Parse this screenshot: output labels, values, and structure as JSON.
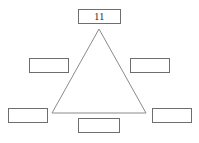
{
  "page": {
    "background_color": "#ffffff",
    "width": 199,
    "height": 143
  },
  "diagram": {
    "name": "triangle-diagram",
    "shape": "triangle",
    "stroke_color": "#8a8a8a",
    "fill": "none",
    "vertices": {
      "apex": {
        "x": 99,
        "y": 29
      },
      "bottom_left": {
        "x": 52,
        "y": 113
      },
      "bottom_right": {
        "x": 146,
        "y": 113
      }
    }
  },
  "boxes": [
    {
      "name": "box-top",
      "position": "top",
      "value": "11",
      "filled": true,
      "x": 78,
      "y": 9,
      "width": 43,
      "height": 15
    },
    {
      "name": "box-left-middle",
      "position": "left-middle",
      "value": "",
      "filled": false,
      "x": 29,
      "y": 58,
      "width": 40,
      "height": 15
    },
    {
      "name": "box-right-middle",
      "position": "right-middle",
      "value": "",
      "filled": false,
      "x": 130,
      "y": 58,
      "width": 40,
      "height": 15
    },
    {
      "name": "box-bottom-left",
      "position": "bottom-left",
      "value": "",
      "filled": false,
      "x": 8,
      "y": 108,
      "width": 40,
      "height": 15
    },
    {
      "name": "box-bottom-right",
      "position": "bottom-right",
      "value": "",
      "filled": false,
      "x": 152,
      "y": 108,
      "width": 40,
      "height": 15
    },
    {
      "name": "box-bottom-center",
      "position": "bottom-center",
      "value": "",
      "filled": false,
      "x": 78,
      "y": 118,
      "width": 42,
      "height": 15
    }
  ],
  "colors": {
    "box_border": "#6e6e6e",
    "triangle_stroke": "#8a8a8a",
    "text": "#1b1b1b",
    "background": "#ffffff"
  }
}
